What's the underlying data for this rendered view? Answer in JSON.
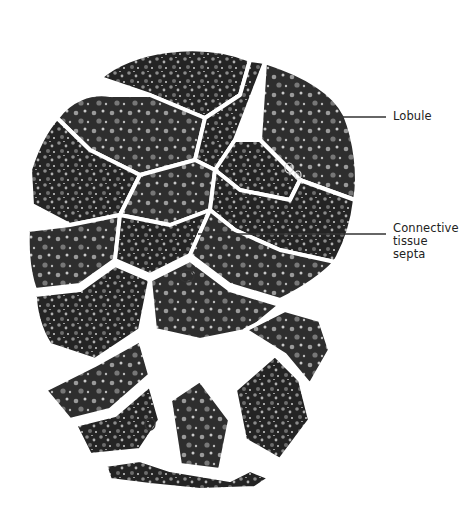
{
  "figure": {
    "colors": {
      "background": "#ffffff",
      "tissue_dark": "#1e1e1e",
      "tissue_mid": "#5a5a5a",
      "septa": "#ffffff",
      "label_text": "#222222",
      "leader_line": "#333333"
    }
  },
  "labels": [
    {
      "id": "lobule",
      "text": "Lobule",
      "line": {
        "x1": 340,
        "y1": 117,
        "x2": 386,
        "y2": 117
      }
    },
    {
      "id": "septa",
      "lines": [
        "Connective",
        "tissue",
        "septa"
      ],
      "line": {
        "x1": 198,
        "y1": 234,
        "x2": 386,
        "y2": 234
      }
    }
  ]
}
